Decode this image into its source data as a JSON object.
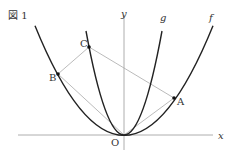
{
  "figure": {
    "title": "図 1",
    "axes": {
      "x_label": "x",
      "y_label": "y",
      "origin_label": "O"
    },
    "curves": [
      {
        "name": "f",
        "label": "f",
        "note": "wider parabola through O, A, B"
      },
      {
        "name": "g",
        "label": "g",
        "note": "narrower parabola through O, C"
      }
    ],
    "points": [
      {
        "label": "A",
        "on": "f"
      },
      {
        "label": "B",
        "on": "f"
      },
      {
        "label": "C",
        "on": "g"
      }
    ],
    "segments": [
      "O-A",
      "A-C",
      "C-B",
      "B-O"
    ],
    "colors": {
      "curve": "#222222",
      "axis": "#999999",
      "segment": "#aaaaaa",
      "text": "#333333"
    }
  }
}
